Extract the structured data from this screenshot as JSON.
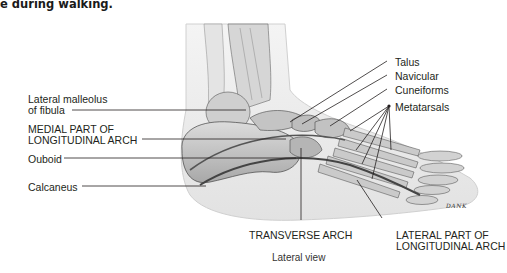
{
  "caption_fragment": "e during walking.",
  "view_label": "Lateral view",
  "signature": "DANK",
  "left_labels": {
    "lateral_malleolus_line1": "Lateral malleolus",
    "lateral_malleolus_line2": "of fibula",
    "medial_arch_line1": "MEDIAL PART OF",
    "medial_arch_line2": "LONGITUDINAL ARCH",
    "cuboid": "Ouboid",
    "calcaneus": "Calcaneus"
  },
  "right_labels": {
    "talus": "Talus",
    "navicular": "Navicular",
    "cuneiforms": "Cuneiforms",
    "metatarsals": "Metatarsals"
  },
  "bottom_labels": {
    "transverse_arch": "TRANSVERSE ARCH",
    "lateral_arch_line1": "LATERAL PART OF",
    "lateral_arch_line2": "LONGITUDINAL ARCH"
  }
}
